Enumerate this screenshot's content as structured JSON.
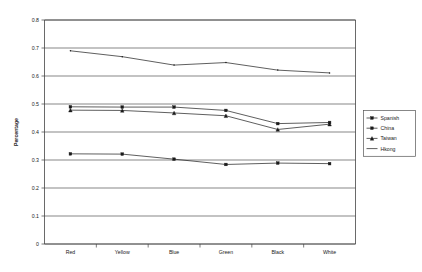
{
  "chart_data": {
    "type": "line",
    "title": "",
    "xlabel": "",
    "ylabel": "Percentage",
    "categories": [
      "Red",
      "Yellow",
      "Blue",
      "Green",
      "Black",
      "White"
    ],
    "ylim": [
      0,
      0.8
    ],
    "ytick_labels": [
      "0.8",
      "0.7",
      "0.6",
      "0.5",
      "0.4",
      "0.3",
      "0.2",
      "0.1",
      "0"
    ],
    "ytick_values": [
      0.8,
      0.7,
      0.6,
      0.5,
      0.4,
      0.3,
      0.2,
      0.1,
      0
    ],
    "grid": true,
    "legend_position": "right",
    "series": [
      {
        "name": "Spanish",
        "marker": "square",
        "values": [
          0.322,
          0.321,
          0.303,
          0.284,
          0.289,
          0.287
        ]
      },
      {
        "name": "China",
        "marker": "square",
        "values": [
          0.49,
          0.489,
          0.489,
          0.477,
          0.43,
          0.434
        ]
      },
      {
        "name": "Taiwan",
        "marker": "triangle",
        "values": [
          0.478,
          0.477,
          0.468,
          0.458,
          0.409,
          0.428
        ]
      },
      {
        "name": "Hkong",
        "marker": "none",
        "values": [
          0.69,
          0.669,
          0.639,
          0.648,
          0.621,
          0.611
        ]
      }
    ]
  },
  "legend": {
    "entries": [
      {
        "label": "Spanish"
      },
      {
        "label": "China"
      },
      {
        "label": "Taiwan"
      },
      {
        "label": "Hkong"
      }
    ]
  },
  "colors": {
    "line": "#1a1a1a",
    "grid": "#555555",
    "axis": "#444444",
    "background": "#ffffff"
  }
}
